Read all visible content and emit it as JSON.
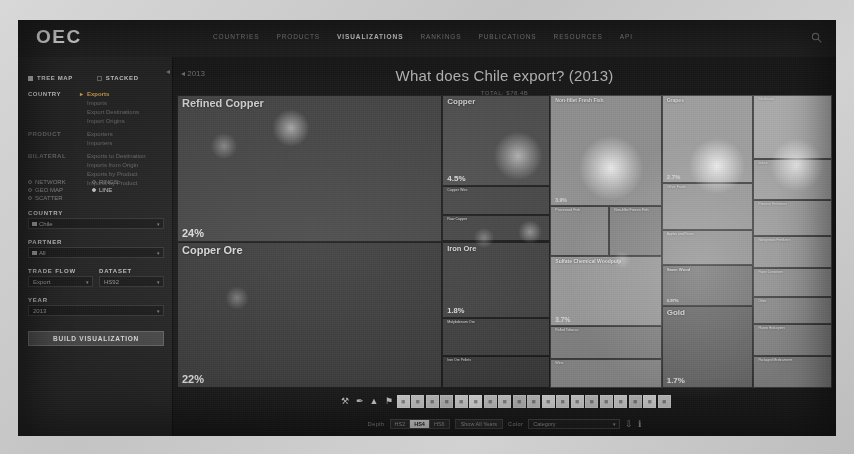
{
  "header": {
    "logo": "OEC",
    "nav": [
      {
        "label": "COUNTRIES",
        "active": false
      },
      {
        "label": "PRODUCTS",
        "active": false
      },
      {
        "label": "VISUALIZATIONS",
        "active": true
      },
      {
        "label": "RANKINGS",
        "active": false
      },
      {
        "label": "PUBLICATIONS",
        "active": false
      },
      {
        "label": "RESOURCES",
        "active": false
      },
      {
        "label": "API",
        "active": false
      }
    ],
    "search_icon": "search-icon"
  },
  "sidebar": {
    "mode_treemap": "TREE MAP",
    "mode_stacked": "STACKED",
    "groups": [
      {
        "label": "COUNTRY",
        "active": true,
        "options": [
          {
            "label": "Exports",
            "selected": true
          },
          {
            "label": "Imports",
            "selected": false
          },
          {
            "label": "Export Destinations",
            "selected": false
          },
          {
            "label": "Import Origins",
            "selected": false
          }
        ]
      },
      {
        "label": "PRODUCT",
        "active": false,
        "options": [
          {
            "label": "Exporters",
            "selected": false
          },
          {
            "label": "Importers",
            "selected": false
          }
        ]
      },
      {
        "label": "BILATERAL",
        "active": false,
        "options": [
          {
            "label": "Exports to Destination",
            "selected": false
          },
          {
            "label": "Imports from Origin",
            "selected": false
          },
          {
            "label": "Exports by Product",
            "selected": false
          },
          {
            "label": "Imports by Product",
            "selected": false
          }
        ]
      }
    ],
    "viz_types": [
      {
        "label": "NETWORK",
        "on": false
      },
      {
        "label": "RINGS",
        "on": false
      },
      {
        "label": "GEO MAP",
        "on": false
      },
      {
        "label": "LINE",
        "on": true
      },
      {
        "label": "SCATTER",
        "on": false
      }
    ],
    "fields": {
      "country_label": "COUNTRY",
      "country_value": "Chile",
      "partner_label": "PARTNER",
      "partner_value": "All",
      "tradeflow_label": "TRADE FLOW",
      "tradeflow_value": "Export",
      "dataset_label": "DATASET",
      "dataset_value": "HS92",
      "year_label": "YEAR",
      "year_value": "2013"
    },
    "build_button": "BUILD VISUALIZATION"
  },
  "viz": {
    "title": "What does Chile export? (2013)",
    "year_back": "◂ 2013",
    "total": "TOTAL: $78.4B"
  },
  "chart_data": {
    "type": "treemap",
    "title": "What does Chile export? (2013)",
    "unit": "percent of total exports",
    "nodes": [
      {
        "name": "Refined Copper",
        "pct": "24%",
        "value": 24.0,
        "group": "Metals",
        "x": 0,
        "y": 0,
        "w": 40.5,
        "h": 50,
        "color": "#4a4a4a",
        "label_size": 11,
        "pct_size": 11
      },
      {
        "name": "Copper Ore",
        "pct": "22%",
        "value": 22.0,
        "group": "Mineral Products",
        "x": 0,
        "y": 50,
        "w": 40.5,
        "h": 50,
        "color": "#3f3f3f",
        "label_size": 11,
        "pct_size": 11
      },
      {
        "name": "Copper",
        "pct": "4.5%",
        "value": 4.5,
        "group": "Metals",
        "x": 40.5,
        "y": 0,
        "w": 16.5,
        "h": 31,
        "color": "#565656",
        "label_size": 8,
        "pct_size": 8
      },
      {
        "name": "Copper Wire",
        "pct": "0.71%",
        "value": 0.71,
        "group": "Metals",
        "x": 40.5,
        "y": 31,
        "w": 16.5,
        "h": 10,
        "color": "#4d4d4d",
        "label_size": 3.6,
        "pct_size": 3.6
      },
      {
        "name": "Raw Copper",
        "pct": "0.52%",
        "value": 0.52,
        "group": "Metals",
        "x": 40.5,
        "y": 41,
        "w": 16.5,
        "h": 9,
        "color": "#4a4a4a",
        "label_size": 3.6,
        "pct_size": 3.6
      },
      {
        "name": "Iron Ore",
        "pct": "1.8%",
        "value": 1.8,
        "group": "Mineral Products",
        "x": 40.5,
        "y": 50,
        "w": 16.5,
        "h": 26,
        "color": "#474747",
        "label_size": 7.5,
        "pct_size": 7.5
      },
      {
        "name": "Molybdenum Ore",
        "pct": "0.93%",
        "value": 0.93,
        "group": "Mineral Products",
        "x": 40.5,
        "y": 76,
        "w": 16.5,
        "h": 13,
        "color": "#434343",
        "label_size": 3.6,
        "pct_size": 3.6
      },
      {
        "name": "Iron Ore Pellets",
        "pct": "0.31%",
        "value": 0.31,
        "group": "Mineral Products",
        "x": 40.5,
        "y": 89,
        "w": 16.5,
        "h": 11,
        "color": "#3d3d3d",
        "label_size": 3.4,
        "pct_size": 3.4
      },
      {
        "name": "Non-fillet Fresh Fish",
        "pct": "3.9%",
        "value": 3.9,
        "group": "Animal Products",
        "x": 57,
        "y": 0,
        "w": 17,
        "h": 38,
        "color": "#9e9e9e",
        "label_size": 5,
        "pct_size": 5
      },
      {
        "name": "Processed Fish",
        "pct": "1.2%",
        "value": 1.2,
        "group": "Animal Products",
        "x": 57,
        "y": 38,
        "w": 9,
        "h": 17,
        "color": "#969696",
        "label_size": 3.6,
        "pct_size": 3.6
      },
      {
        "name": "Non-fillet Frozen Fish",
        "pct": "0.86%",
        "value": 0.86,
        "group": "Animal Products",
        "x": 66,
        "y": 38,
        "w": 8,
        "h": 17,
        "color": "#8e8e8e",
        "label_size": 3.6,
        "pct_size": 3.6
      },
      {
        "name": "Sulfate Chemical Woodpulp",
        "pct": "3.7%",
        "value": 3.7,
        "group": "Paper Goods",
        "x": 57,
        "y": 55,
        "w": 17,
        "h": 24,
        "color": "#a4a4a4",
        "label_size": 5,
        "pct_size": 6.5
      },
      {
        "name": "Rolled Tobacco",
        "pct": "0.42%",
        "value": 0.42,
        "group": "Foodstuffs",
        "x": 57,
        "y": 79,
        "w": 17,
        "h": 11,
        "color": "#8a8a8a",
        "label_size": 3.4,
        "pct_size": 3.4
      },
      {
        "name": "Wine",
        "pct": "2.4%",
        "value": 2.4,
        "group": "Foodstuffs",
        "x": 57,
        "y": 90,
        "w": 17,
        "h": 10,
        "color": "#8f8f8f",
        "label_size": 3.6,
        "pct_size": 3.6
      },
      {
        "name": "Grapes",
        "pct": "2.7%",
        "value": 2.7,
        "group": "Vegetable Products",
        "x": 74,
        "y": 0,
        "w": 14,
        "h": 30,
        "color": "#b0b0b0",
        "label_size": 5,
        "pct_size": 6
      },
      {
        "name": "Other Fruits",
        "pct": "1.3%",
        "value": 1.3,
        "group": "Vegetable Products",
        "x": 74,
        "y": 30,
        "w": 14,
        "h": 16,
        "color": "#a8a8a8",
        "label_size": 3.6,
        "pct_size": 3.6
      },
      {
        "name": "Apples and Pears",
        "pct": "0.86%",
        "value": 0.86,
        "group": "Vegetable Products",
        "x": 74,
        "y": 46,
        "w": 14,
        "h": 12,
        "color": "#a0a0a0",
        "label_size": 3.4,
        "pct_size": 3.4
      },
      {
        "name": "Sawn Wood",
        "pct": "0.97%",
        "value": 0.97,
        "group": "Wood Products",
        "x": 74,
        "y": 58,
        "w": 14,
        "h": 14,
        "color": "#7e7e7e",
        "label_size": 4.2,
        "pct_size": 4.2
      },
      {
        "name": "Gold",
        "pct": "1.7%",
        "value": 1.7,
        "group": "Precious Metals",
        "x": 74,
        "y": 72,
        "w": 14,
        "h": 28,
        "color": "#6b6b6b",
        "label_size": 8,
        "pct_size": 8
      },
      {
        "name": "Methanol",
        "pct": "1.1%",
        "value": 1.1,
        "group": "Chemical Products",
        "x": 88,
        "y": 0,
        "w": 12,
        "h": 22,
        "color": "#bdbdbd",
        "label_size": 3.8,
        "pct_size": 3.8
      },
      {
        "name": "Iodine",
        "pct": "0.62%",
        "value": 0.62,
        "group": "Chemical Products",
        "x": 88,
        "y": 22,
        "w": 12,
        "h": 14,
        "color": "#b4b4b4",
        "label_size": 3.4,
        "pct_size": 3.4
      },
      {
        "name": "Potassic Fertilizers",
        "pct": "0.47%",
        "value": 0.47,
        "group": "Chemical Products",
        "x": 88,
        "y": 36,
        "w": 12,
        "h": 12,
        "color": "#adadad",
        "label_size": 3.4,
        "pct_size": 3.4
      },
      {
        "name": "Nitrogenous Fertilizers",
        "pct": "0.38%",
        "value": 0.38,
        "group": "Chemical Products",
        "x": 88,
        "y": 48,
        "w": 12,
        "h": 11,
        "color": "#a6a6a6",
        "label_size": 3.2,
        "pct_size": 3.2
      },
      {
        "name": "Paper Containers",
        "pct": "0.29%",
        "value": 0.29,
        "group": "Paper Goods",
        "x": 88,
        "y": 59,
        "w": 12,
        "h": 10,
        "color": "#9d9d9d",
        "label_size": 3.2,
        "pct_size": 3.2
      },
      {
        "name": "Other",
        "pct": "0.25%",
        "value": 0.25,
        "group": "Misc",
        "x": 88,
        "y": 69,
        "w": 12,
        "h": 9,
        "color": "#949494",
        "label_size": 3.2,
        "pct_size": 3.2
      },
      {
        "name": "Planes Helicopters",
        "pct": "0.21%",
        "value": 0.21,
        "group": "Transportation",
        "x": 88,
        "y": 78,
        "w": 12,
        "h": 11,
        "color": "#8c8c8c",
        "label_size": 3.2,
        "pct_size": 3.2
      },
      {
        "name": "Packaged Medicaments",
        "pct": "0.18%",
        "value": 0.18,
        "group": "Chemical Products",
        "x": 88,
        "y": 89,
        "w": 12,
        "h": 11,
        "color": "#858585",
        "label_size": 3.2,
        "pct_size": 3.2
      }
    ]
  },
  "legend": {
    "icons": [
      "agriculture-icon",
      "hide-icon",
      "foodstuffs-icon",
      "animal-products-icon",
      "vegetable-products-icon",
      "mineral-products-icon",
      "chemical-products-icon",
      "plastics-icon",
      "paper-goods-icon",
      "textiles-icon",
      "footwear-icon",
      "stone-glass-icon",
      "precious-metals-icon",
      "metals-icon",
      "machines-icon",
      "transportation-icon",
      "instruments-icon",
      "weapons-icon",
      "arts-antiques-icon",
      "misc-icon",
      "unspecified-icon",
      "services-icon",
      "wood-products-icon"
    ]
  },
  "controls": {
    "depth_label": "Depth",
    "depth_options": [
      {
        "label": "HS2",
        "on": false
      },
      {
        "label": "HS4",
        "on": true
      },
      {
        "label": "HS6",
        "on": false
      }
    ],
    "show_all_years": "Show All Years",
    "color_label": "Color",
    "color_value": "Category",
    "download_icon": "download-icon",
    "info_icon": "info-icon"
  }
}
